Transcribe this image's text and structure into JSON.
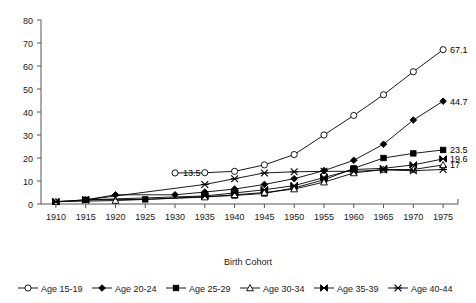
{
  "chart_data": {
    "type": "line",
    "title": "",
    "xlabel": "Birth Cohort",
    "ylabel": "",
    "xlim": [
      1907.5,
      1977.5
    ],
    "ylim": [
      0,
      80
    ],
    "grid": false,
    "legend_position": "bottom",
    "x_ticks": [
      "1910",
      "1915",
      "1920",
      "1925",
      "1930",
      "1935",
      "1940",
      "1945",
      "1950",
      "1955",
      "1960",
      "1965",
      "1970",
      "1975"
    ],
    "y_ticks": [
      "0",
      "10",
      "20",
      "30",
      "40",
      "50",
      "60",
      "70",
      "80"
    ],
    "categories": [
      1910,
      1915,
      1920,
      1925,
      1930,
      1935,
      1940,
      1945,
      1950,
      1955,
      1960,
      1965,
      1970,
      1975
    ],
    "series": [
      {
        "name": "Age 15-19",
        "marker": "open-circle",
        "x": [
          1930,
          1935,
          1940,
          1945,
          1950,
          1955,
          1960,
          1965,
          1970,
          1975
        ],
        "values": [
          13.5,
          13.6,
          14.2,
          17.0,
          21.5,
          30.0,
          38.5,
          47.5,
          57.5,
          67.1
        ],
        "end_label": "67.1"
      },
      {
        "name": "Age 20-24",
        "marker": "filled-diamond",
        "x": [
          1915,
          1920,
          1930,
          1935,
          1940,
          1945,
          1950,
          1955,
          1960,
          1965,
          1970,
          1975
        ],
        "values": [
          1.8,
          4.0,
          4.0,
          5.2,
          6.5,
          8.5,
          11.0,
          14.5,
          19.0,
          26.0,
          36.5,
          44.7
        ],
        "end_label": "44.7"
      },
      {
        "name": "Age 25-29",
        "marker": "filled-square",
        "x": [
          1915,
          1925,
          1935,
          1940,
          1945,
          1950,
          1955,
          1960,
          1965,
          1970,
          1975
        ],
        "values": [
          1.8,
          2.0,
          3.2,
          3.7,
          4.6,
          7.0,
          10.5,
          15.5,
          20.0,
          22.0,
          23.5
        ],
        "end_label": "23.5"
      },
      {
        "name": "Age 30-34",
        "marker": "open-triangle",
        "x": [
          1910,
          1920,
          1935,
          1940,
          1945,
          1950,
          1955,
          1960,
          1965,
          1970,
          1975
        ],
        "values": [
          1.0,
          1.5,
          3.0,
          4.0,
          5.0,
          6.5,
          9.5,
          13.5,
          15.0,
          15.0,
          17.0
        ],
        "end_label": "17"
      },
      {
        "name": "Age 35-39",
        "marker": "bowtie",
        "x": [
          1910,
          1915,
          1935,
          1940,
          1945,
          1950,
          1955,
          1960,
          1965,
          1970,
          1975
        ],
        "values": [
          1.0,
          1.8,
          3.5,
          4.8,
          6.2,
          8.0,
          11.5,
          15.0,
          15.5,
          17.0,
          19.6
        ],
        "end_label": "19.6"
      },
      {
        "name": "Age 40-44",
        "marker": "asterisk",
        "x": [
          1910,
          1915,
          1935,
          1940,
          1945,
          1950,
          1955,
          1960,
          1965,
          1970,
          1975
        ],
        "values": [
          1.0,
          1.8,
          8.5,
          11.0,
          13.5,
          14.0,
          14.2,
          14.2,
          14.8,
          14.5,
          15.0
        ],
        "end_label": ""
      }
    ],
    "annotations": [
      {
        "text": "13.5",
        "x": 1930,
        "y": 13.5,
        "marker": "open-circle"
      }
    ],
    "end_labels": [
      "67.1",
      "44.7",
      "23.5",
      "19.6",
      "17"
    ]
  },
  "legend": {
    "items": [
      {
        "label": "Age 15-19",
        "marker": "open-circle"
      },
      {
        "label": "Age 20-24",
        "marker": "filled-diamond"
      },
      {
        "label": "Age 25-29",
        "marker": "filled-square"
      },
      {
        "label": "Age 30-34",
        "marker": "open-triangle"
      },
      {
        "label": "Age 35-39",
        "marker": "bowtie"
      },
      {
        "label": "Age 40-44",
        "marker": "asterisk"
      }
    ]
  }
}
